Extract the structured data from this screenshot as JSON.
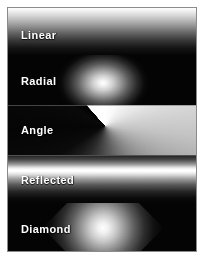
{
  "figure": {
    "frame_border_color": "#8b8b8b",
    "background_color": "#ffffff"
  },
  "chart_data": {
    "type": "table",
    "subtitle": "",
    "xlabel": "",
    "ylabel": "",
    "legend_position": "inline-left",
    "grid": false,
    "categories": [
      "Linear",
      "Radial",
      "Angle",
      "Reflected",
      "Diamond"
    ],
    "swatches": [
      {
        "label": "Linear",
        "gradient_type": "linear",
        "direction": "top-to-bottom",
        "from_color": "#ffffff",
        "to_color": "#000000",
        "band_height_px": 47
      },
      {
        "label": "Radial",
        "gradient_type": "radial",
        "center_x_px": 95,
        "center_y_px": 28,
        "from_color": "#ffffff",
        "to_color": "#000000",
        "band_height_px": 50
      },
      {
        "label": "Angle",
        "gradient_type": "angle",
        "center_x_px": 97,
        "center_y_px": 21,
        "from_color": "#ffffff",
        "to_color": "#000000",
        "band_height_px": 50
      },
      {
        "label": "Reflected",
        "gradient_type": "reflected",
        "direction": "top-to-bottom-mirrored",
        "from_color": "#ffffff",
        "to_color": "#000000",
        "band_height_px": 48
      },
      {
        "label": "Diamond",
        "gradient_type": "diamond",
        "center_x_px": 95,
        "center_y_px": 25,
        "from_color": "#ffffff",
        "to_color": "#000000",
        "band_height_px": 50
      }
    ]
  }
}
